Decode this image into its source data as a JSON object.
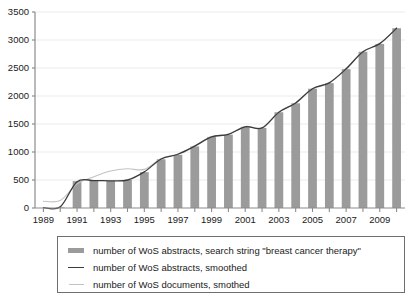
{
  "chart_data": {
    "type": "bar",
    "title": "",
    "xlabel": "",
    "ylabel": "",
    "xlim": [
      1988.5,
      2010.5
    ],
    "ylim": [
      0,
      3500
    ],
    "yticks": [
      0,
      500,
      1000,
      1500,
      2000,
      2500,
      3000,
      3500
    ],
    "ytick_labels": [
      "0",
      "500",
      "1000",
      "1500",
      "2000",
      "2500",
      "3000",
      "3500"
    ],
    "xticks": [
      1989,
      1990,
      1991,
      1992,
      1993,
      1994,
      1995,
      1996,
      1997,
      1998,
      1999,
      2000,
      2001,
      2002,
      2003,
      2004,
      2005,
      2006,
      2007,
      2008,
      2009,
      2010
    ],
    "xtick_labels_shown": [
      "1989",
      "1991",
      "1993",
      "1995",
      "1997",
      "1999",
      "2001",
      "2003",
      "2005",
      "2007",
      "2009"
    ],
    "xtick_label_step": 2,
    "grid": "horizontal",
    "categories": [
      1989,
      1990,
      1991,
      1992,
      1993,
      1994,
      1995,
      1996,
      1997,
      1998,
      1999,
      2000,
      2001,
      2002,
      2003,
      2004,
      2005,
      2006,
      2007,
      2008,
      2009,
      2010
    ],
    "values": [
      0,
      10,
      480,
      495,
      485,
      500,
      640,
      870,
      950,
      1100,
      1270,
      1310,
      1450,
      1430,
      1710,
      1870,
      2130,
      2230,
      2480,
      2790,
      2930,
      3210
    ],
    "series": [
      {
        "name": "number of WoS abstracts, search string \"breast cancer therapy\"",
        "type": "bar",
        "color": "#9b9b9b",
        "values": [
          0,
          10,
          480,
          495,
          485,
          500,
          640,
          870,
          950,
          1100,
          1270,
          1310,
          1450,
          1430,
          1710,
          1870,
          2130,
          2230,
          2480,
          2790,
          2930,
          3210
        ]
      },
      {
        "name": "number of WoS abstracts, smoothed",
        "type": "line",
        "color": "#3b3b3b",
        "values": [
          5,
          20,
          470,
          490,
          485,
          500,
          645,
          875,
          960,
          1105,
          1270,
          1315,
          1450,
          1430,
          1710,
          1875,
          2130,
          2235,
          2485,
          2790,
          2935,
          3210
        ]
      },
      {
        "name": "number of WoS documents, smothed",
        "type": "line",
        "color": "#c3c3c3",
        "values": [
          120,
          135,
          430,
          560,
          660,
          700,
          690,
          880,
          965,
          1110,
          1275,
          1320,
          1455,
          1435,
          1715,
          1880,
          2135,
          2240,
          2490,
          2795,
          2940,
          3215
        ]
      }
    ],
    "legend_position": "below-plot"
  },
  "legend": {
    "entries": [
      {
        "swatch": "bar-swatch",
        "label": "number of WoS abstracts, search string \"breast cancer therapy\""
      },
      {
        "swatch": "dark-line-swatch",
        "label": "number of WoS abstracts, smoothed"
      },
      {
        "swatch": "light-line-swatch",
        "label": "number of WoS documents, smothed"
      }
    ]
  },
  "colors": {
    "bar": "#9b9b9b",
    "abstracts_line": "#3b3b3b",
    "documents_line": "#c3c3c3",
    "grid": "#ebebeb",
    "axis": "#8c8c8c",
    "text": "#1a1a1a",
    "legend_border": "#6e6e6e",
    "background": "#ffffff"
  }
}
